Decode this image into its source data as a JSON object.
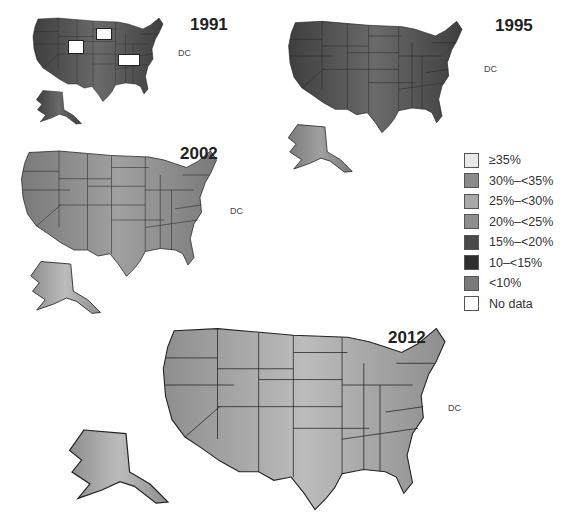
{
  "maps": [
    {
      "year": "1991",
      "dc_label": "DC"
    },
    {
      "year": "1995",
      "dc_label": "DC"
    },
    {
      "year": "2002",
      "dc_label": "DC"
    },
    {
      "year": "2012",
      "dc_label": "DC"
    }
  ],
  "legend": {
    "items": [
      {
        "label": "≥35%",
        "color": "#e8e8e8"
      },
      {
        "label": "30%–<35%",
        "color": "#8a8a8a"
      },
      {
        "label": "25%–<30%",
        "color": "#a8a8a8"
      },
      {
        "label": "20%–<25%",
        "color": "#8e8e8e"
      },
      {
        "label": "15%–<20%",
        "color": "#4a4a4a"
      },
      {
        "label": "10–<15%",
        "color": "#2e2e2e"
      },
      {
        "label": "<10%",
        "color": "#7a7a7a"
      },
      {
        "label": "No data",
        "color": "#ffffff"
      }
    ]
  },
  "colors": {
    "dark": "#555555",
    "mid": "#8c8c8c",
    "light": "#a4a4a4",
    "border": "#222222"
  }
}
